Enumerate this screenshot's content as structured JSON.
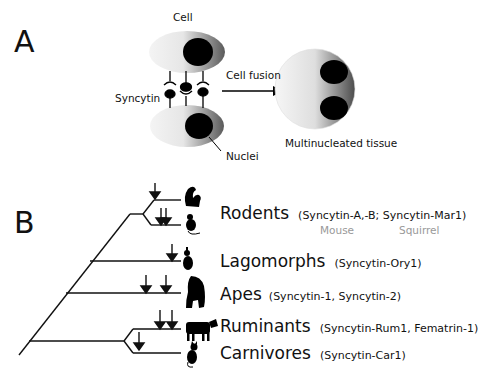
{
  "panel_a": {
    "letter": "A",
    "labels": {
      "cell": "Cell",
      "syncytin": "Syncytin",
      "nuclei": "Nuclei",
      "cell_fusion": "Cell fusion",
      "multinucleated": "Multinucleated tissue"
    }
  },
  "panel_b": {
    "letter": "B",
    "clades": [
      {
        "name": "Rodents",
        "genes": "(Syncytin-A,-B; Syncytin-Mar1)",
        "species": [
          "Mouse",
          "Squirrel"
        ],
        "icons": [
          "squirrel-icon",
          "mouse-icon"
        ]
      },
      {
        "name": "Lagomorphs",
        "genes": "(Syncytin-Ory1)",
        "icons": [
          "rabbit-icon"
        ]
      },
      {
        "name": "Apes",
        "genes": "(Syncytin-1, Syncytin-2)",
        "icons": [
          "ape-icon"
        ]
      },
      {
        "name": "Ruminants",
        "genes": "(Syncytin-Rum1, Fematrin-1)",
        "icons": [
          "cow-icon"
        ]
      },
      {
        "name": "Carnivores",
        "genes": "(Syncytin-Car1)",
        "icons": [
          "cat-icon"
        ]
      }
    ]
  }
}
